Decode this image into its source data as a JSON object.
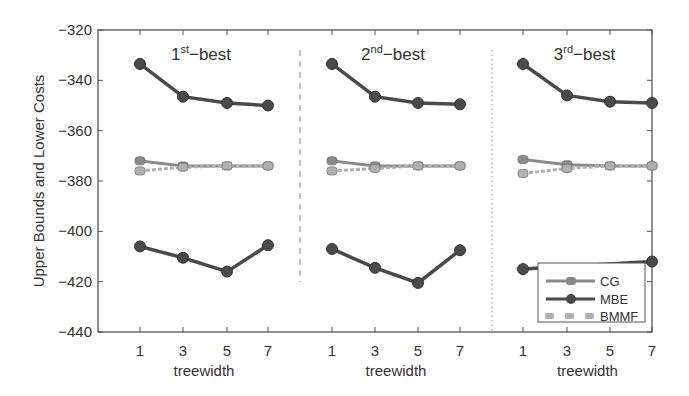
{
  "chart_data": {
    "type": "line",
    "ylabel": "Upper Bounds and Lower Costs",
    "xlabel": "treewidth",
    "ylim": [
      -440,
      -320
    ],
    "yticks": [
      -320,
      -340,
      -360,
      -380,
      -400,
      -420,
      -440
    ],
    "x": [
      1,
      3,
      5,
      7
    ],
    "xticks": [
      "1",
      "3",
      "5",
      "7"
    ],
    "grid": false,
    "legend_position": "lower right",
    "legend": [
      "CG",
      "MBE",
      "BMMF"
    ],
    "panels": [
      {
        "title": "1",
        "title_sup": "st",
        "title_suffix": "-best",
        "series": [
          {
            "name": "MBE",
            "role": "upper",
            "values": [
              -333.5,
              -346.5,
              -349,
              -350
            ]
          },
          {
            "name": "MBE",
            "role": "lower",
            "values": [
              -406,
              -410.5,
              -416,
              -405.5
            ]
          },
          {
            "name": "CG",
            "values": [
              -372,
              -374,
              -374,
              -374
            ]
          },
          {
            "name": "BMMF",
            "values": [
              -376,
              -374.5,
              -374,
              -374
            ]
          }
        ]
      },
      {
        "title": "2",
        "title_sup": "nd",
        "title_suffix": "-best",
        "series": [
          {
            "name": "MBE",
            "role": "upper",
            "values": [
              -333.5,
              -346.5,
              -349,
              -349.5
            ]
          },
          {
            "name": "MBE",
            "role": "lower",
            "values": [
              -407,
              -414.5,
              -420.5,
              -407.5
            ]
          },
          {
            "name": "CG",
            "values": [
              -372,
              -374,
              -374,
              -374
            ]
          },
          {
            "name": "BMMF",
            "values": [
              -376,
              -375,
              -374,
              -374
            ]
          }
        ]
      },
      {
        "title": "3",
        "title_sup": "rd",
        "title_suffix": "-best",
        "series": [
          {
            "name": "MBE",
            "role": "upper",
            "values": [
              -333.5,
              -346,
              -348.5,
              -349
            ]
          },
          {
            "name": "MBE",
            "role": "lower",
            "values": [
              -415,
              null,
              null,
              -412
            ]
          },
          {
            "name": "CG",
            "values": [
              -371.5,
              -373.5,
              -374,
              -374
            ]
          },
          {
            "name": "BMMF",
            "values": [
              -377,
              -375,
              -374,
              -374
            ]
          }
        ]
      }
    ]
  },
  "colors": {
    "mbe": "#4a4a4a",
    "cg": "#8a8a8a",
    "bmmf": "#b0b0b0",
    "axis": "#555555"
  }
}
